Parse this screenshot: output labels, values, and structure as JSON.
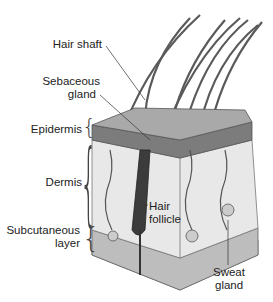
{
  "diagram": {
    "labels": {
      "hair_shaft": "Hair shaft",
      "sebaceous_1": "Sebaceous",
      "sebaceous_2": "gland",
      "epidermis": "Epidermis",
      "dermis": "Dermis",
      "subcutaneous_1": "Subcutaneous",
      "subcutaneous_2": "layer",
      "hair_follicle_1": "Hair",
      "hair_follicle_2": "follicle",
      "sweat_1": "Sweat",
      "sweat_2": "gland"
    },
    "colors": {
      "epidermis_top": "#a8a8a8",
      "epidermis_side": "#7a7a7a",
      "dermis": "#e6e6e6",
      "subcutaneous": "#b9b9b9",
      "follicle": "#3c3c3c",
      "hair": "#555555"
    }
  }
}
